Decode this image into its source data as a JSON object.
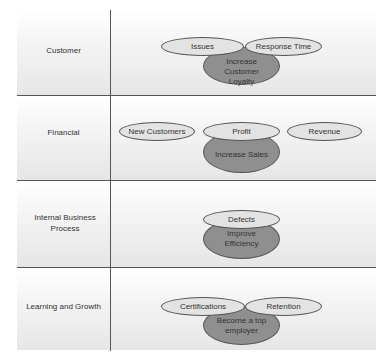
{
  "rows": [
    {
      "label": "Customer",
      "goal": "Increase Customer Loyalty",
      "measures": [
        "Issues",
        "Response Time"
      ]
    },
    {
      "label": "Financial",
      "goal": "Increase Sales",
      "measures": [
        "New Customers",
        "Profit",
        "Revenue"
      ]
    },
    {
      "label": "Internal Business Process",
      "goal": "Improve Efficiency",
      "measures": [
        "Defects"
      ]
    },
    {
      "label": "Learning and Growth",
      "goal": "Become a top employer",
      "measures": [
        "Certifications",
        "Retention"
      ]
    }
  ],
  "colors": {
    "goal_fill": "#8f8f8f",
    "measure_fill": "#e3e3e3",
    "line": "#555555"
  }
}
